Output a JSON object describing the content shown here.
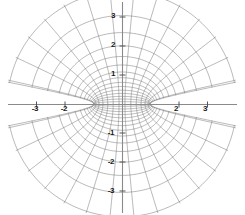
{
  "figure": {
    "title": "",
    "background_color": "#ffffff",
    "width": 245,
    "height": 215
  },
  "axes": {
    "origin": {
      "x": 122,
      "y": 104
    },
    "unit_px_x": 28.5,
    "unit_px_y": 29.0,
    "axis_color": "#808080",
    "axis_line_width": 1.0,
    "tick_color": "#555555",
    "xaxis": {
      "name": "x-axis",
      "label": "",
      "range": [
        -4.3,
        4.3
      ],
      "tick_values": [
        -3,
        -2,
        2,
        3
      ],
      "tick_labels": [
        "-3",
        "-2",
        "2",
        "3"
      ],
      "hidden_tick_values": [
        -1,
        1
      ],
      "hidden_tick_labels": [
        "-1",
        "1"
      ]
    },
    "yaxis": {
      "name": "y-axis",
      "label": "",
      "range": [
        -3.6,
        3.6
      ],
      "tick_values": [
        3,
        2,
        1,
        -1,
        -2,
        -3
      ],
      "tick_labels": [
        "3",
        "2",
        "1",
        "-1",
        "-2",
        "-3"
      ]
    }
  },
  "chart_data": {
    "type": "line",
    "title": "",
    "subtitle": "",
    "xlabel": "",
    "ylabel": "",
    "xlim": [
      -4.3,
      4.3
    ],
    "ylim": [
      -3.6,
      3.6
    ],
    "grid": false,
    "legend": null,
    "foci": [
      {
        "name": "left-focus",
        "x": -1,
        "y": 0
      },
      {
        "name": "right-focus",
        "x": 1,
        "y": 0
      }
    ],
    "series": [
      {
        "name": "confocal-ellipses",
        "family": "ellipse",
        "color": "#707070",
        "line_width": 0.5,
        "u_values": [
          0.08,
          0.17,
          0.26,
          0.36,
          0.46,
          0.57,
          0.69,
          0.82,
          0.96,
          1.11,
          1.27,
          1.45,
          1.64,
          1.85,
          2.08
        ],
        "semi_major_a": [
          1.003,
          1.014,
          1.034,
          1.065,
          1.107,
          1.166,
          1.245,
          1.35,
          1.489,
          1.676,
          1.92,
          2.241,
          2.659,
          3.215,
          4.015
        ],
        "semi_minor_b": [
          0.08,
          0.171,
          0.263,
          0.364,
          0.476,
          0.603,
          0.745,
          0.906,
          1.104,
          1.345,
          1.638,
          2.005,
          2.462,
          3.049,
          3.89
        ]
      },
      {
        "name": "confocal-hyperbolas",
        "family": "hyperbola",
        "color": "#707070",
        "line_width": 0.5,
        "v_values_deg": [
          0,
          12,
          24,
          36,
          48,
          60,
          72,
          84,
          96,
          108,
          120,
          132,
          144,
          156,
          168,
          180
        ],
        "count": 16
      }
    ],
    "gap": {
      "name": "axis-wedge-gap",
      "description": "Angular wedge excluded adjacent to the x-axis on both sides",
      "half_angle_deg": 11
    }
  },
  "annotations": {
    "x_tick_labels": [
      {
        "text": "-3",
        "x": 35,
        "y": 109
      },
      {
        "text": "-2",
        "x": 64,
        "y": 109
      },
      {
        "text": "2",
        "x": 176,
        "y": 109
      },
      {
        "text": "3",
        "x": 205,
        "y": 109
      }
    ],
    "y_tick_labels": [
      {
        "text": "3",
        "x": 113,
        "y": 16
      },
      {
        "text": "2",
        "x": 113,
        "y": 45
      },
      {
        "text": "1",
        "x": 113,
        "y": 74
      },
      {
        "text": "-1",
        "x": 111,
        "y": 133
      },
      {
        "text": "-2",
        "x": 111,
        "y": 162
      },
      {
        "text": "-3",
        "x": 111,
        "y": 191
      }
    ]
  }
}
